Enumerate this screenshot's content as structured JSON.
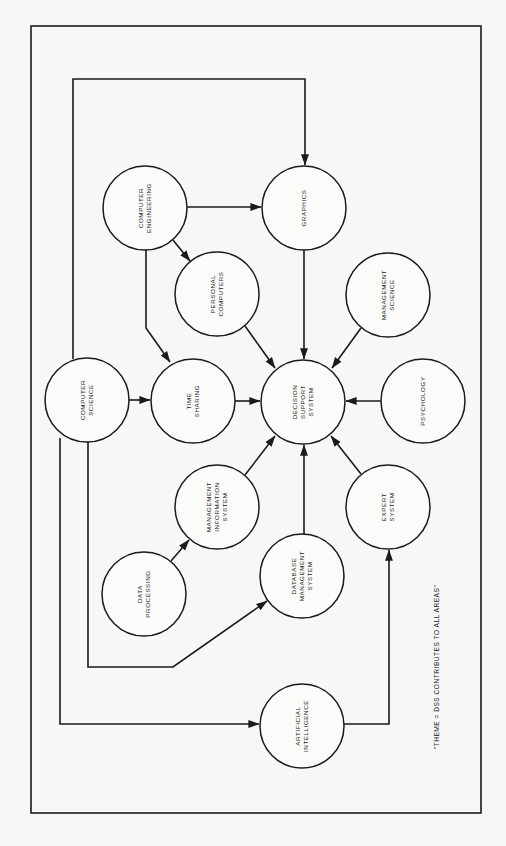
{
  "diagram": {
    "caption": "\"THEME = DSS CONTRIBUTES TO ALL AREAS\"",
    "nodes": {
      "computer_engineering": {
        "lines": [
          "COMPUTER",
          "ENGINEERING"
        ],
        "cx": 145,
        "cy": 208
      },
      "graphics": {
        "lines": [
          "GRAPHICS"
        ],
        "cx": 304,
        "cy": 208
      },
      "personal_computers": {
        "lines": [
          "PERSONAL",
          "COMPUTERS"
        ],
        "cx": 217,
        "cy": 294
      },
      "management_science": {
        "lines": [
          "MANAGEMENT",
          "SCIENCE"
        ],
        "cx": 388,
        "cy": 295
      },
      "computer_science": {
        "lines": [
          "COMPUTER",
          "SCIENCE"
        ],
        "cx": 87,
        "cy": 400
      },
      "time_sharing": {
        "lines": [
          "TIME",
          "SHARING"
        ],
        "cx": 193,
        "cy": 401
      },
      "decision_support_system": {
        "lines": [
          "DECISION",
          "SUPPORT",
          "SYSTEM"
        ],
        "cx": 303,
        "cy": 402
      },
      "psychology": {
        "lines": [
          "PSYCHOLOGY"
        ],
        "cx": 423,
        "cy": 401
      },
      "management_information_system": {
        "lines": [
          "MANAGEMENT",
          "INFORMATION",
          "SYSTEM"
        ],
        "cx": 217,
        "cy": 507
      },
      "expert_system": {
        "lines": [
          "EXPERT",
          "SYSTEM"
        ],
        "cx": 388,
        "cy": 507
      },
      "data_processing": {
        "lines": [
          "DATA",
          "PROCESSING"
        ],
        "cx": 144,
        "cy": 594
      },
      "database_management_system": {
        "lines": [
          "DATABASE",
          "MANAGEMENT",
          "SYSTEM"
        ],
        "cx": 302,
        "cy": 576
      },
      "artificial_intelligence": {
        "lines": [
          "ARTIFICIAL",
          "INTELLIGENCE"
        ],
        "cx": 302,
        "cy": 726
      }
    },
    "edges": [
      {
        "from": "computer_science",
        "to": "graphics"
      },
      {
        "from": "computer_engineering",
        "to": "graphics"
      },
      {
        "from": "computer_engineering",
        "to": "personal_computers"
      },
      {
        "from": "computer_engineering",
        "to": "time_sharing"
      },
      {
        "from": "computer_science",
        "to": "time_sharing"
      },
      {
        "from": "time_sharing",
        "to": "decision_support_system"
      },
      {
        "from": "graphics",
        "to": "decision_support_system"
      },
      {
        "from": "personal_computers",
        "to": "decision_support_system"
      },
      {
        "from": "management_science",
        "to": "decision_support_system"
      },
      {
        "from": "psychology",
        "to": "decision_support_system"
      },
      {
        "from": "management_information_system",
        "to": "decision_support_system"
      },
      {
        "from": "database_management_system",
        "to": "decision_support_system"
      },
      {
        "from": "expert_system",
        "to": "decision_support_system"
      },
      {
        "from": "data_processing",
        "to": "management_information_system"
      },
      {
        "from": "computer_science",
        "to": "database_management_system"
      },
      {
        "from": "computer_science",
        "to": "artificial_intelligence"
      },
      {
        "from": "artificial_intelligence",
        "to": "expert_system"
      }
    ]
  }
}
